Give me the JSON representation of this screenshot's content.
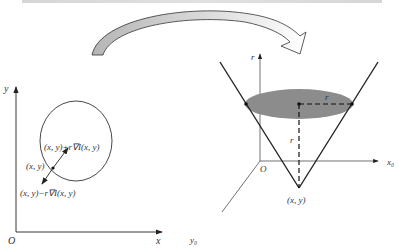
{
  "left_figure": {
    "axis_y_label": "y",
    "axis_x_label": "x",
    "origin_label": "O",
    "point_label": "(x, y)",
    "plus_label": "(x, y)+r∇I(x, y)",
    "minus_label": "(x, y)−r∇I(x, y)"
  },
  "right_figure": {
    "axis_r_label": "r",
    "axis_x0_label": "x₀",
    "axis_y0_label": "y₀",
    "origin_label": "O",
    "radius_label_horizontal": "r",
    "radius_label_vertical": "r",
    "apex_label": "(x, y)"
  },
  "colors": {
    "line": "#222222",
    "ellipse_fill": "#8c8c8c",
    "arrow_fill": "#bdbdbd"
  }
}
